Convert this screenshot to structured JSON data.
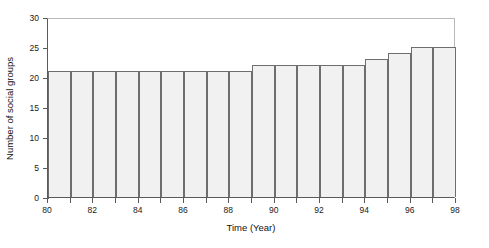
{
  "chart_data": {
    "type": "bar",
    "title": "",
    "subtitle": "",
    "xlabel": "Time (Year)",
    "ylabel": "Number of social groups",
    "categories": [
      80,
      81,
      82,
      83,
      84,
      85,
      86,
      87,
      88,
      89,
      90,
      91,
      92,
      93,
      94,
      95,
      96,
      97
    ],
    "values": [
      21,
      21,
      21,
      21,
      21,
      21,
      21,
      21,
      21,
      22,
      22,
      22,
      22,
      22,
      23,
      24,
      25,
      25
    ],
    "xlim": [
      80,
      98
    ],
    "ylim": [
      0,
      30
    ],
    "y_ticks": [
      0,
      5,
      10,
      15,
      20,
      25,
      30
    ],
    "y_tick_labels": [
      "0",
      "5",
      "10",
      "15",
      "20",
      "25",
      "30"
    ],
    "x_ticks": [
      80,
      81,
      82,
      83,
      84,
      85,
      86,
      87,
      88,
      89,
      90,
      91,
      92,
      93,
      94,
      95,
      96,
      97,
      98
    ],
    "x_tick_labels_shown": [
      "80",
      "82",
      "84",
      "86",
      "88",
      "90",
      "92",
      "94",
      "96",
      "98"
    ],
    "x_labeled_ticks": [
      80,
      82,
      84,
      86,
      88,
      90,
      92,
      94,
      96,
      98
    ],
    "grid": false,
    "legend": null,
    "bar_fill_color": "#f1f1f1",
    "bar_edge_color": "#6e6e6e",
    "axis_color": "#5a5a5a",
    "frame_color": "#b9b9b9",
    "background_color": "#ffffff",
    "text_color": "#111111"
  }
}
